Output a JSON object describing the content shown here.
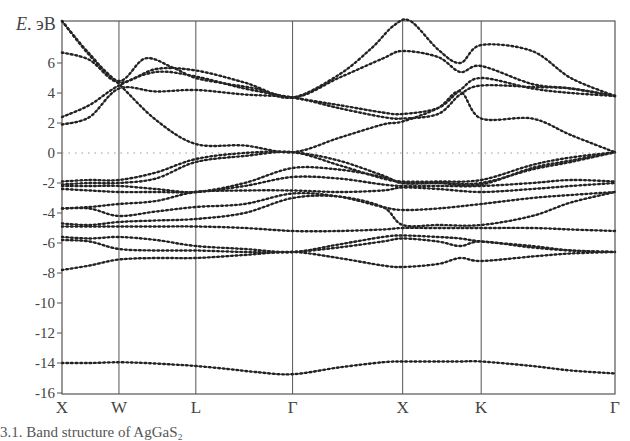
{
  "chart_data": {
    "type": "line",
    "title": "",
    "ylabel": "E, эВ",
    "xlabel": "",
    "ylim": [
      -16,
      8.8
    ],
    "y_ticks": [
      6,
      4,
      2,
      0,
      -2,
      -4,
      -6,
      -8,
      -10,
      -12,
      -14,
      -16
    ],
    "x_ticks": [
      {
        "label": "X",
        "pos": 0.0
      },
      {
        "label": "W",
        "pos": 0.103
      },
      {
        "label": "L",
        "pos": 0.242
      },
      {
        "label": "Γ",
        "pos": 0.417
      },
      {
        "label": "X",
        "pos": 0.616
      },
      {
        "label": "K",
        "pos": 0.758
      },
      {
        "label": "Γ",
        "pos": 1.0
      }
    ],
    "fermi_level": 0,
    "grid": false,
    "legend": null,
    "series": [
      {
        "name": "band1",
        "x": [
          0,
          0.05,
          0.103,
          0.15,
          0.2,
          0.242,
          0.3,
          0.35,
          0.417,
          0.5,
          0.58,
          0.616,
          0.68,
          0.72,
          0.758,
          0.85,
          0.92,
          1.0
        ],
        "values": [
          -14.0,
          -14.0,
          -13.95,
          -14.0,
          -14.1,
          -14.2,
          -14.4,
          -14.6,
          -14.75,
          -14.3,
          -13.95,
          -13.9,
          -13.9,
          -13.9,
          -13.9,
          -14.2,
          -14.5,
          -14.7
        ]
      },
      {
        "name": "band2",
        "x": [
          0,
          0.05,
          0.103,
          0.17,
          0.242,
          0.33,
          0.417,
          0.5,
          0.58,
          0.616,
          0.68,
          0.72,
          0.758,
          0.85,
          0.92,
          1.0
        ],
        "values": [
          -7.8,
          -7.5,
          -7.1,
          -7.0,
          -7.0,
          -6.8,
          -6.6,
          -7.0,
          -7.5,
          -7.6,
          -7.4,
          -7.0,
          -7.2,
          -6.9,
          -6.7,
          -6.6
        ]
      },
      {
        "name": "band3",
        "x": [
          0,
          0.05,
          0.103,
          0.17,
          0.242,
          0.33,
          0.417,
          0.5,
          0.58,
          0.616,
          0.68,
          0.72,
          0.758,
          0.85,
          0.92,
          1.0
        ],
        "values": [
          -5.8,
          -5.9,
          -6.4,
          -6.5,
          -6.5,
          -6.6,
          -6.6,
          -6.3,
          -5.9,
          -5.7,
          -5.9,
          -6.2,
          -5.9,
          -6.3,
          -6.5,
          -6.6
        ]
      },
      {
        "name": "band4",
        "x": [
          0,
          0.05,
          0.103,
          0.17,
          0.242,
          0.33,
          0.417,
          0.5,
          0.58,
          0.616,
          0.68,
          0.72,
          0.758,
          0.85,
          0.92,
          1.0
        ],
        "values": [
          -5.6,
          -5.7,
          -5.6,
          -5.8,
          -6.2,
          -6.4,
          -6.6,
          -6.1,
          -5.6,
          -5.5,
          -5.6,
          -5.7,
          -5.9,
          -6.2,
          -6.5,
          -6.6
        ]
      },
      {
        "name": "band5",
        "x": [
          0,
          0.05,
          0.103,
          0.17,
          0.242,
          0.33,
          0.417,
          0.5,
          0.58,
          0.616,
          0.68,
          0.758,
          0.85,
          0.92,
          1.0
        ],
        "values": [
          -4.9,
          -4.9,
          -4.9,
          -4.9,
          -4.9,
          -5.0,
          -5.2,
          -5.2,
          -5.1,
          -5.0,
          -5.0,
          -5.0,
          -5.0,
          -5.1,
          -5.2
        ]
      },
      {
        "name": "band6",
        "x": [
          0,
          0.05,
          0.103,
          0.17,
          0.242,
          0.33,
          0.417,
          0.5,
          0.58,
          0.616,
          0.68,
          0.758,
          0.85,
          0.92,
          1.0
        ],
        "values": [
          -4.7,
          -4.8,
          -4.6,
          -4.5,
          -4.4,
          -4.0,
          -3.0,
          -2.9,
          -3.6,
          -4.8,
          -4.8,
          -4.8,
          -4.2,
          -3.3,
          -2.6
        ]
      },
      {
        "name": "band7",
        "x": [
          0,
          0.05,
          0.103,
          0.17,
          0.242,
          0.33,
          0.417,
          0.5,
          0.58,
          0.616,
          0.68,
          0.758,
          0.85,
          0.92,
          1.0
        ],
        "values": [
          -3.7,
          -3.7,
          -4.2,
          -3.9,
          -3.6,
          -3.4,
          -2.7,
          -2.9,
          -3.6,
          -3.8,
          -3.7,
          -3.4,
          -3.0,
          -2.8,
          -2.6
        ]
      },
      {
        "name": "band8",
        "x": [
          0,
          0.05,
          0.103,
          0.17,
          0.242,
          0.33,
          0.417,
          0.5,
          0.58,
          0.616,
          0.68,
          0.758,
          0.85,
          0.92,
          1.0
        ],
        "values": [
          -3.7,
          -3.6,
          -3.4,
          -3.2,
          -2.6,
          -2.5,
          -2.5,
          -2.6,
          -2.5,
          -2.3,
          -2.4,
          -2.6,
          -2.4,
          -2.2,
          -2.0
        ]
      },
      {
        "name": "band9",
        "x": [
          0,
          0.05,
          0.103,
          0.17,
          0.242,
          0.33,
          0.417,
          0.5,
          0.58,
          0.616,
          0.68,
          0.758,
          0.85,
          0.92,
          1.0
        ],
        "values": [
          -2.4,
          -2.5,
          -2.6,
          -2.6,
          -2.6,
          -2.2,
          -1.6,
          -1.7,
          -2.1,
          -2.2,
          -2.2,
          -2.2,
          -2.0,
          -1.8,
          -1.9
        ]
      },
      {
        "name": "band10",
        "x": [
          0,
          0.05,
          0.103,
          0.17,
          0.242,
          0.33,
          0.417,
          0.5,
          0.58,
          0.616,
          0.68,
          0.758,
          0.85,
          0.92,
          1.0
        ],
        "values": [
          -2.2,
          -2.2,
          -2.2,
          -2.4,
          -2.6,
          -2.0,
          -1.0,
          -1.1,
          -1.6,
          -2.0,
          -2.0,
          -2.0,
          -1.1,
          -0.6,
          0.05
        ]
      },
      {
        "name": "band11",
        "x": [
          0,
          0.05,
          0.103,
          0.17,
          0.242,
          0.33,
          0.417,
          0.5,
          0.58,
          0.616,
          0.68,
          0.758,
          0.85,
          0.92,
          1.0
        ],
        "values": [
          -2.1,
          -2.0,
          -2.0,
          -1.7,
          -0.6,
          -0.2,
          0.05,
          -0.8,
          -1.7,
          -1.9,
          -1.9,
          -1.8,
          -0.8,
          -0.3,
          0.05
        ]
      },
      {
        "name": "band12",
        "x": [
          0,
          0.05,
          0.103,
          0.17,
          0.242,
          0.33,
          0.417,
          0.5,
          0.58,
          0.616,
          0.68,
          0.758,
          0.85,
          0.92,
          1.0
        ],
        "values": [
          -1.9,
          -1.8,
          -1.8,
          -1.3,
          -0.4,
          0.0,
          0.05,
          -0.5,
          -1.5,
          -2.0,
          -2.0,
          -2.1,
          -1.0,
          -0.5,
          0.05
        ]
      },
      {
        "name": "band13",
        "x": [
          0,
          0.05,
          0.103,
          0.17,
          0.242,
          0.33,
          0.417,
          0.5,
          0.58,
          0.616,
          0.68,
          0.72,
          0.758,
          0.85,
          0.92,
          1.0
        ],
        "values": [
          1.9,
          2.4,
          4.3,
          4.1,
          4.2,
          3.9,
          3.7,
          3.0,
          2.4,
          2.3,
          2.6,
          3.9,
          4.5,
          4.4,
          4.3,
          3.8
        ]
      },
      {
        "name": "band14",
        "x": [
          0,
          0.05,
          0.103,
          0.17,
          0.242,
          0.33,
          0.417,
          0.5,
          0.58,
          0.616,
          0.68,
          0.72,
          0.758,
          0.85,
          0.92,
          1.0
        ],
        "values": [
          2.4,
          3.2,
          4.5,
          5.4,
          5.1,
          4.3,
          3.7,
          3.2,
          2.7,
          2.6,
          3.0,
          4.2,
          5.0,
          4.3,
          4.0,
          3.8
        ]
      },
      {
        "name": "band15",
        "x": [
          0,
          0.05,
          0.103,
          0.17,
          0.242,
          0.33,
          0.417,
          0.5,
          0.58,
          0.616,
          0.68,
          0.72,
          0.758,
          0.85,
          0.92,
          1.0
        ],
        "values": [
          6.7,
          6.2,
          4.7,
          5.6,
          5.5,
          4.7,
          3.7,
          5.0,
          6.3,
          6.8,
          6.4,
          5.4,
          5.8,
          4.6,
          4.3,
          3.8
        ]
      },
      {
        "name": "band16",
        "x": [
          0,
          0.05,
          0.103,
          0.15,
          0.2,
          0.242,
          0.3,
          0.35,
          0.417,
          0.5,
          0.56,
          0.6,
          0.63,
          0.68,
          0.72,
          0.758,
          0.85,
          0.92,
          1.0
        ],
        "values": [
          8.8,
          6.6,
          4.8,
          6.3,
          5.7,
          5.0,
          4.6,
          4.3,
          3.7,
          5.2,
          7.0,
          8.5,
          8.8,
          6.9,
          6.0,
          7.2,
          6.8,
          5.0,
          3.8
        ]
      },
      {
        "name": "band17",
        "x": [
          0,
          0.05,
          0.103,
          0.17,
          0.242,
          0.33,
          0.417,
          0.5,
          0.58,
          0.616,
          0.68,
          0.72,
          0.758,
          0.85,
          0.92,
          1.0
        ],
        "values": [
          8.8,
          6.5,
          4.6,
          2.2,
          0.6,
          0.5,
          0.05,
          1.0,
          1.9,
          2.1,
          3.0,
          4.1,
          2.3,
          2.3,
          1.2,
          0.05
        ]
      }
    ]
  },
  "axis": {
    "y_label_E": "E",
    "y_label_unit": ". эВ",
    "y_ticks": [
      "6",
      "4",
      "2",
      "0",
      "-2",
      "-4",
      "-6",
      "-8",
      "-10",
      "-12",
      "-14",
      "-16"
    ],
    "x_labels": [
      "X",
      "W",
      "L",
      "Γ",
      "X",
      "K",
      "Γ"
    ]
  },
  "caption": "3.1.  Band structure of AgGaS₂"
}
